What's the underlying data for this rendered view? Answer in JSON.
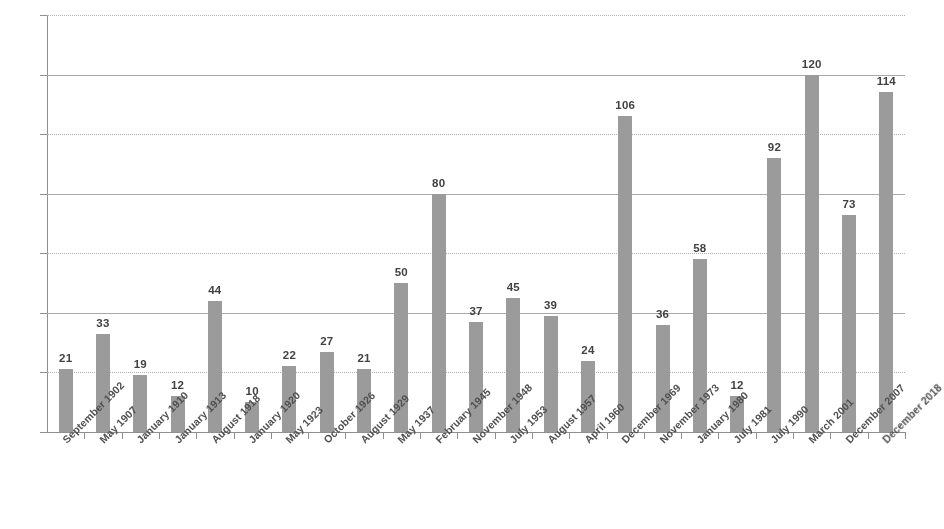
{
  "chart_data": {
    "type": "bar",
    "title": "",
    "subtitle": "",
    "xlabel": "",
    "ylabel": "",
    "ylim": [
      0,
      140
    ],
    "ytick_step": 20,
    "yticks": [
      0,
      20,
      40,
      60,
      80,
      100,
      120,
      140
    ],
    "grid": true,
    "grid_axis": "y",
    "legend": null,
    "legend_position": "none",
    "bar_color": "#9a9a9a",
    "highlight_color": "#cdcdcd",
    "highlight_index": 23,
    "data_labels": true,
    "categories": [
      "September 1902",
      "May 1907",
      "January 1910",
      "January 1913",
      "August 1918",
      "January 1920",
      "May 1923",
      "October 1926",
      "August 1929",
      "May 1937",
      "February 1945",
      "November 1948",
      "July 1953",
      "August 1957",
      "April 1960",
      "December 1969",
      "November 1973",
      "January 1980",
      "July 1981",
      "July 1990",
      "March 2001",
      "December 2007",
      "December 2018"
    ],
    "values": [
      21,
      33,
      19,
      12,
      44,
      10,
      22,
      27,
      21,
      50,
      80,
      37,
      45,
      39,
      24,
      106,
      36,
      58,
      12,
      92,
      120,
      73,
      114
    ]
  }
}
